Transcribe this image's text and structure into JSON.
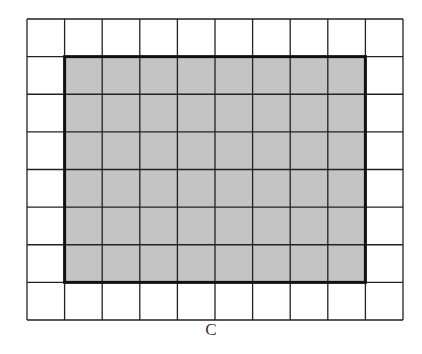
{
  "figure": {
    "label": "C",
    "grid": {
      "columns": 10,
      "rows": 8
    },
    "shaded_region": {
      "col_start": 1,
      "col_end": 9,
      "row_start": 1,
      "row_end": 7,
      "width_cells": 8,
      "height_cells": 6
    },
    "colors": {
      "shade": "#c4c4c4",
      "line": "#222222",
      "background": "#ffffff"
    }
  }
}
